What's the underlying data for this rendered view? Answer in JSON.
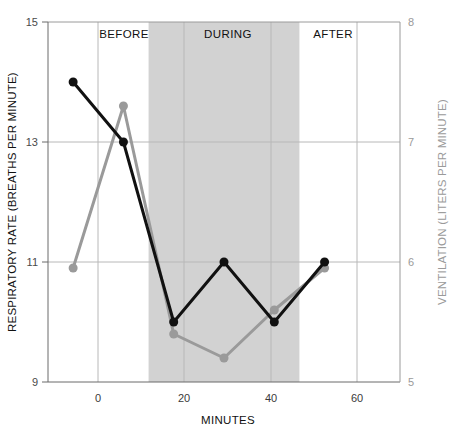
{
  "chart_data": {
    "type": "line",
    "title": "",
    "xlabel": "MINUTES",
    "x": [
      0,
      10,
      20,
      30,
      40,
      50
    ],
    "xlim": [
      -5,
      65
    ],
    "xticks": [
      0,
      20,
      40,
      60
    ],
    "xticklabels": [
      "0",
      "20",
      "40",
      "60"
    ],
    "grid": true,
    "legend": "none",
    "series": [
      {
        "name": "Respiratory Rate",
        "axis": "left",
        "color": "#111111",
        "marker": "circle",
        "values": [
          14.0,
          13.0,
          10.0,
          11.0,
          10.0,
          11.0
        ]
      },
      {
        "name": "Ventilation",
        "axis": "right",
        "color": "#9a9a9a",
        "marker": "circle",
        "values": [
          5.95,
          7.3,
          5.4,
          5.2,
          5.6,
          5.95
        ]
      }
    ],
    "axes": {
      "left": {
        "label": "RESPIRATORY RATE (BREATHS PER MINUTE)",
        "ylim": [
          9,
          15
        ],
        "yticks": [
          9,
          11,
          13,
          15
        ],
        "yticklabels": [
          "9",
          "11",
          "13",
          "15"
        ],
        "color": "#111111"
      },
      "right": {
        "label": "VENTILATION (LITERS PER MINUTE)",
        "ylim": [
          5,
          8
        ],
        "yticks": [
          5,
          6,
          7,
          8
        ],
        "yticklabels": [
          "5",
          "6",
          "7",
          "8"
        ],
        "color": "#9a9a9a"
      }
    },
    "annotations": {
      "phases": [
        {
          "label": "BEFORE",
          "x_start": -5,
          "x_end": 15,
          "shaded": false
        },
        {
          "label": "DURING",
          "x_start": 15,
          "x_end": 45,
          "shaded": true
        },
        {
          "label": "AFTER",
          "x_start": 45,
          "x_end": 65,
          "shaded": false
        }
      ],
      "shade_color": "#d2d2d2"
    }
  }
}
